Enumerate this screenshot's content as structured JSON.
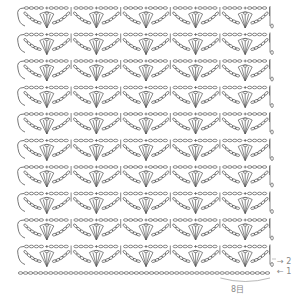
{
  "diagram": {
    "type": "crochet-chart",
    "repeats_across": 5,
    "motif_rows": 10,
    "row_pitch": 26.5,
    "first_row_y": 8,
    "left_x": 22,
    "right_x": 270,
    "repeat_width": 49.6,
    "stroke_color": "#555555",
    "label_color": "#888888"
  },
  "labels": {
    "row2_marker": "→ 2",
    "row1_marker": "← 1",
    "repeat_label": "8目"
  }
}
